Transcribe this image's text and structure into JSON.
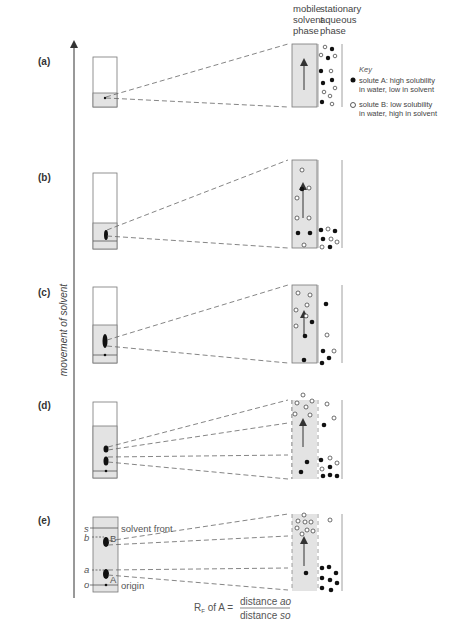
{
  "headers": {
    "mobile": [
      "mobile",
      "solvent",
      "phase"
    ],
    "stationary": [
      "stationary",
      "aqueous",
      "phase"
    ]
  },
  "key": {
    "title": "Key",
    "solute_a_line1": "solute A: high solubility",
    "solute_a_line2": "in water, low in solvent",
    "solute_b_line1": "solute B: low solubility",
    "solute_b_line2": "in water, high in solvent"
  },
  "axis_label": "movement of solvent",
  "panels": [
    {
      "label": "(a)"
    },
    {
      "label": "(b)"
    },
    {
      "label": "(c)"
    },
    {
      "label": "(d)"
    },
    {
      "label": "(e)"
    }
  ],
  "panel_e": {
    "s": "s",
    "b": "b",
    "a": "a",
    "o": "o",
    "spot_b": "B",
    "spot_a": "A",
    "solvent_front": "solvent front",
    "origin": "origin"
  },
  "formula": {
    "lhs_r": "R",
    "lhs_sub": "F",
    "lhs_rest": " of A =",
    "numerator_text": "distance ",
    "numerator_var": "ao",
    "denominator_text": "distance ",
    "denominator_var": "so"
  },
  "colors": {
    "solvent_fill": "#e3e3e3",
    "line": "#555555",
    "solute_a": "#111111",
    "solute_b": "#ffffff"
  }
}
